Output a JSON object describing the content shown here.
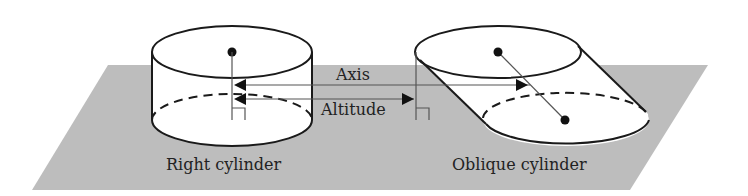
{
  "figure": {
    "labels": {
      "axis": "Axis",
      "altitude": "Altitude",
      "right_cylinder": "Right cylinder",
      "oblique_cylinder": "Oblique cylinder"
    },
    "colors": {
      "plane": "#bdbdbd",
      "stroke": "#1a1a1a",
      "guide_line": "#555555",
      "background": "#ffffff"
    },
    "shapes": [
      "gray-base-plane",
      "right-cylinder",
      "oblique-cylinder"
    ]
  }
}
